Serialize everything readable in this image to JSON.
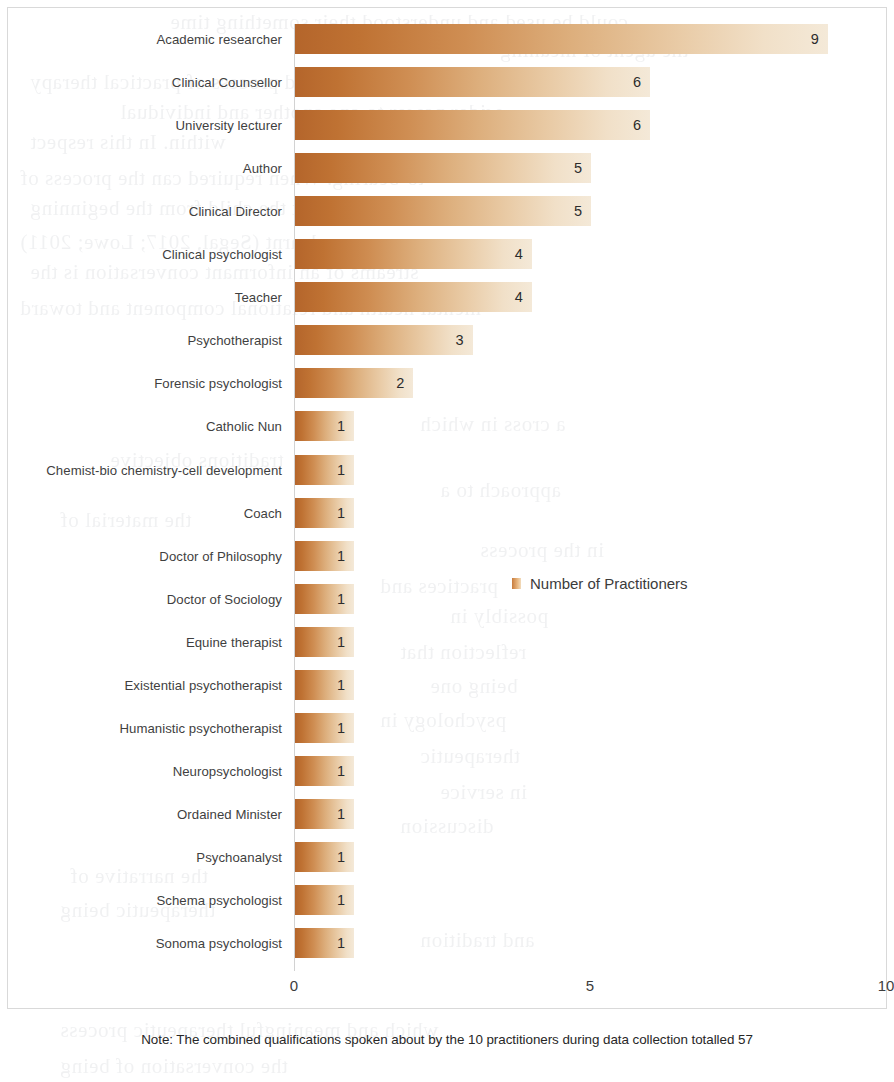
{
  "chart_data": {
    "type": "bar",
    "orientation": "horizontal",
    "title": "",
    "xlabel": "",
    "ylabel": "",
    "xlim": [
      0,
      10
    ],
    "xticks": [
      "0",
      "5",
      "10"
    ],
    "grid": false,
    "legend": {
      "position": "inside-right-middle",
      "entries": [
        "Number of Practitioners"
      ],
      "swatch_color": "#d79353"
    },
    "note": "Note: The combined qualifications spoken about by the 10 practitioners during data collection totalled 57",
    "series": [
      {
        "name": "Number of Practitioners",
        "categories": [
          "Academic researcher",
          "Clinical Counsellor",
          "University lecturer",
          "Author",
          "Clinical Director",
          "Clinical psychologist",
          "Teacher",
          "Psychotherapist",
          "Forensic psychologist",
          "Catholic Nun",
          "Chemist-bio chemistry-cell development",
          "Coach",
          "Doctor of Philosophy",
          "Doctor of Sociology",
          "Equine therapist",
          "Existential psychotherapist",
          "Humanistic psychotherapist",
          "Neuropsychologist",
          "Ordained Minister",
          "Psychoanalyst",
          "Schema psychologist",
          "Sonoma psychologist"
        ],
        "values": [
          9,
          6,
          6,
          5,
          5,
          4,
          4,
          3,
          2,
          1,
          1,
          1,
          1,
          1,
          1,
          1,
          1,
          1,
          1,
          1,
          1,
          1
        ]
      }
    ],
    "bar_gradient": {
      "start": "#b4652b",
      "end": "#f4e9d8"
    }
  },
  "bleed_text": [
    {
      "x": 170,
      "y": 2,
      "t": "could be used and understood their something time"
    },
    {
      "x": 500,
      "y": 30,
      "t": "the agent of meaning"
    },
    {
      "x": 30,
      "y": 62,
      "t": "offer a renewed process of practical therapy"
    },
    {
      "x": 120,
      "y": 92,
      "t": "wider power to one another and individual"
    },
    {
      "x": 30,
      "y": 122,
      "t": "within. In this respect"
    },
    {
      "x": 20,
      "y": 158,
      "t": "to-bearing. When required can the process of"
    },
    {
      "x": 30,
      "y": 188,
      "t": "it is that the child from the beginning"
    },
    {
      "x": 20,
      "y": 222,
      "t": "learnt (Segal, 2017; Lowe; 2011)"
    },
    {
      "x": 30,
      "y": 252,
      "t": "streams of an informant conversation is the"
    },
    {
      "x": 20,
      "y": 288,
      "t": "mental health and relational component and toward"
    },
    {
      "x": 420,
      "y": 404,
      "t": "a cross in which"
    },
    {
      "x": 110,
      "y": 440,
      "t": "traditions objective"
    },
    {
      "x": 440,
      "y": 470,
      "t": "approach to a"
    },
    {
      "x": 60,
      "y": 500,
      "t": "the material of"
    },
    {
      "x": 480,
      "y": 530,
      "t": "in the process"
    },
    {
      "x": 380,
      "y": 566,
      "t": "practices and"
    },
    {
      "x": 450,
      "y": 596,
      "t": "possibly in"
    },
    {
      "x": 400,
      "y": 632,
      "t": "reflection that"
    },
    {
      "x": 430,
      "y": 666,
      "t": "being one"
    },
    {
      "x": 380,
      "y": 700,
      "t": "psychology in"
    },
    {
      "x": 420,
      "y": 736,
      "t": "therapeutic"
    },
    {
      "x": 440,
      "y": 772,
      "t": "in service"
    },
    {
      "x": 400,
      "y": 806,
      "t": "discussion"
    },
    {
      "x": 70,
      "y": 856,
      "t": "the narrative of"
    },
    {
      "x": 60,
      "y": 890,
      "t": "therapeutic being"
    },
    {
      "x": 420,
      "y": 920,
      "t": "and tradition"
    },
    {
      "x": 60,
      "y": 1010,
      "t": "which and meaningful therapeutic process"
    },
    {
      "x": 60,
      "y": 1046,
      "t": "the conversation of being"
    }
  ]
}
